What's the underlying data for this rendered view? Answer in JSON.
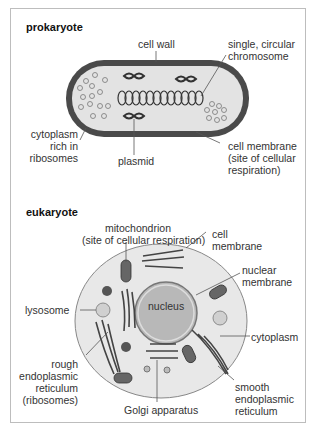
{
  "prokaryote": {
    "title": "prokaryote",
    "labels": {
      "cell_wall": "cell wall",
      "chromosome": "single, circular\nchromosome",
      "cytoplasm": "cytoplasm\nrich in\nribosomes",
      "plasmid": "plasmid",
      "cell_membrane": "cell membrane\n(site of cellular\nrespiration)"
    }
  },
  "eukaryote": {
    "title": "eukaryote",
    "labels": {
      "mitochondrion": "mitochondrion\n(site of cellular respiration)",
      "cell_membrane": "cell\nmembrane",
      "nuclear_membrane": "nuclear\nmembrane",
      "nucleus": "nucleus",
      "lysosome": "lysosome",
      "cytoplasm": "cytoplasm",
      "rough_er": "rough\nendoplasmic\nreticulum\n(ribosomes)",
      "smooth_er": "smooth\nendoplasmic\nreticulum",
      "golgi": "Golgi apparatus"
    }
  },
  "colors": {
    "cell_wall": "#4a4a4a",
    "cytoplasm": "#e3e3e3",
    "nucleus": "#b8b8b8",
    "border": "#bdbdbd"
  }
}
